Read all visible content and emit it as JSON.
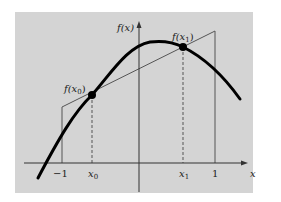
{
  "figure": {
    "background": "#d3d3d3",
    "curve_color": "#000000",
    "line_color": "#555555"
  },
  "axes": {
    "y_label": "f(x)",
    "x_label": "x"
  },
  "ticks": {
    "neg_one": "−1",
    "x0": "x",
    "x0_sub": "0",
    "x1": "x",
    "x1_sub": "1",
    "one": "1"
  },
  "points": {
    "f_x0": {
      "f": "f(x",
      "sub": "0",
      "close": ")"
    },
    "f_x1": {
      "f": "f(x",
      "sub": "1",
      "close": ")"
    }
  }
}
